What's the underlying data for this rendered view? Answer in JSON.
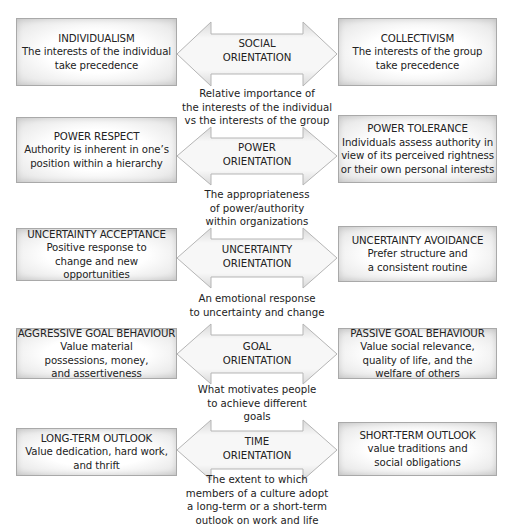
{
  "rows": [
    {
      "left": {
        "title": "INDIVIDUALISM",
        "lines": [
          "The interests of the individual",
          "take precedence"
        ]
      },
      "arrow": {
        "lines": [
          "SOCIAL",
          "ORIENTATION"
        ]
      },
      "right": {
        "title": "COLLECTIVISM",
        "lines": [
          "The interests of the group",
          "take precedence"
        ]
      },
      "description": [
        "Relative importance of",
        "the interests of the individual",
        "vs the interests of the group"
      ]
    },
    {
      "left": {
        "title": "POWER RESPECT",
        "lines": [
          "Authority is inherent in one’s",
          "position within a hierarchy"
        ]
      },
      "arrow": {
        "lines": [
          "POWER",
          "ORIENTATION"
        ]
      },
      "right": {
        "title": "POWER TOLERANCE",
        "lines": [
          "Individuals assess authority in",
          "view of its perceived rightness",
          "or their own personal interests"
        ]
      },
      "description": [
        "The appropriateness",
        "of power/authority",
        "within organizations"
      ]
    },
    {
      "left": {
        "title": "UNCERTAINTY ACCEPTANCE",
        "lines": [
          "Positive response to",
          "change and new",
          "opportunities"
        ]
      },
      "arrow": {
        "lines": [
          "UNCERTAINTY",
          "ORIENTATION"
        ]
      },
      "right": {
        "title": "UNCERTAINTY AVOIDANCE",
        "lines": [
          "Prefer structure and",
          "a consistent routine"
        ]
      },
      "description": [
        "An emotional response",
        "to uncertainty and change"
      ]
    },
    {
      "left": {
        "title": "AGGRESSIVE GOAL BEHAVIOUR",
        "lines": [
          "Value material",
          "possessions, money,",
          "and assertiveness"
        ]
      },
      "arrow": {
        "lines": [
          "GOAL",
          "ORIENTATION"
        ]
      },
      "right": {
        "title": "PASSIVE GOAL BEHAVIOUR",
        "lines": [
          "Value social relevance,",
          "quality of life, and the",
          "welfare of others"
        ]
      },
      "description": [
        "What motivates people",
        "to achieve different",
        "goals"
      ]
    },
    {
      "left": {
        "title": "LONG-TERM OUTLOOK",
        "lines": [
          "Value dedication, hard work,",
          "and thrift"
        ]
      },
      "arrow": {
        "lines": [
          "TIME",
          "ORIENTATION"
        ]
      },
      "right": {
        "title": "SHORT-TERM OUTLOOK",
        "lines": [
          "value traditions and",
          "social obligations"
        ]
      },
      "description": [
        "The extent to which",
        "members of a culture adopt",
        "a long-term or a short-term",
        "outlook on work and life"
      ]
    }
  ],
  "colors": {
    "box_border": "#a9a9a9",
    "arrow_fill": "#f3f3f3",
    "arrow_stroke": "#b5b5b5",
    "text": "#222222"
  }
}
